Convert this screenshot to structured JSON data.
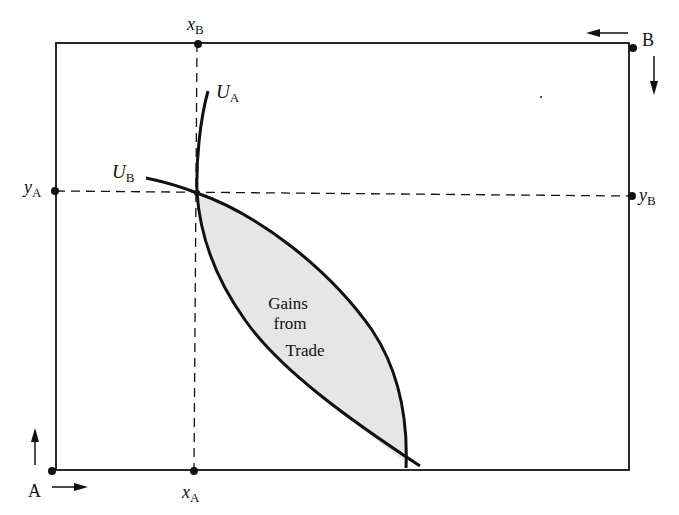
{
  "diagram": {
    "type": "edgeworth-box",
    "origins": {
      "a": {
        "label": "A",
        "arrows": [
          "up",
          "right"
        ]
      },
      "b": {
        "label": "B",
        "arrows": [
          "left",
          "down"
        ]
      }
    },
    "endowment": {
      "x_a": {
        "var": "x",
        "sub": "A"
      },
      "x_b": {
        "var": "x",
        "sub": "B"
      },
      "y_a": {
        "var": "y",
        "sub": "A"
      },
      "y_b": {
        "var": "y",
        "sub": "B"
      }
    },
    "curves": {
      "u_a": {
        "var": "U",
        "sub": "A"
      },
      "u_b": {
        "var": "U",
        "sub": "B"
      }
    },
    "region": {
      "line1": "Gains",
      "line2": "from",
      "line3": "Trade",
      "fill": "#e6e6e6"
    },
    "colors": {
      "ink": "#111111",
      "background": "#ffffff"
    }
  }
}
